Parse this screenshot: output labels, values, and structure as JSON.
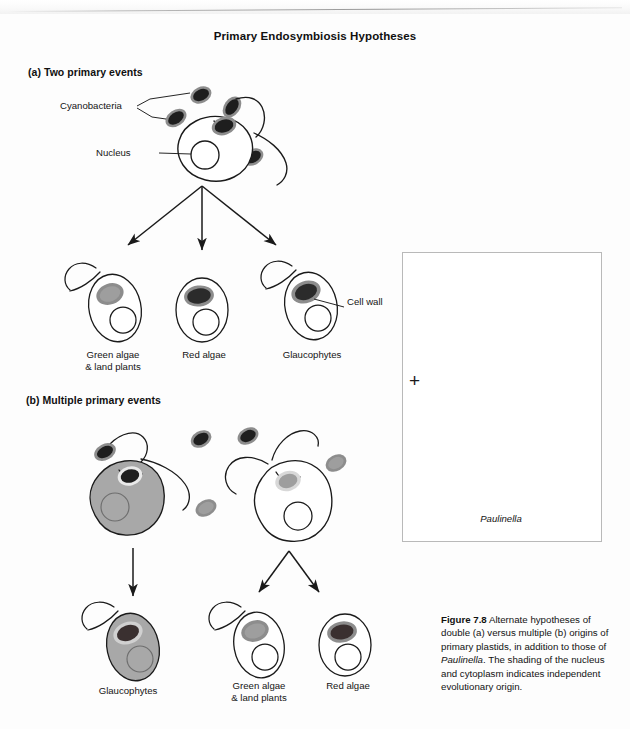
{
  "figure": {
    "title": "Primary Endosymbiosis Hypotheses",
    "number": "Figure 7.8",
    "caption_lead": "Figure 7.8",
    "caption_body_1": " Alternate hypotheses of double (a) versus multiple (b) origins of primary plastids, in addition to those of ",
    "caption_italic": "Paulinella",
    "caption_body_2": ". The shading of the nucleus and cytoplasm indicates independent evolutionary origin."
  },
  "panels": {
    "a": {
      "label": "(a) Two primary events"
    },
    "b": {
      "label": "(b) Multiple primary events"
    }
  },
  "callouts": {
    "cyanobacteria": "Cyanobacteria",
    "nucleus": "Nucleus",
    "cell_wall": "Cell wall"
  },
  "panel_a_outcomes": [
    {
      "line1": "Green algae",
      "line2": "& land plants"
    },
    {
      "line1": "Red algae",
      "line2": ""
    },
    {
      "line1": "Glaucophytes",
      "line2": ""
    }
  ],
  "panel_b_outcomes": [
    {
      "line1": "Glaucophytes",
      "line2": ""
    },
    {
      "line1": "Green algae",
      "line2": "& land plants"
    },
    {
      "line1": "Red algae",
      "line2": ""
    }
  ],
  "inset": {
    "organism": "Paulinella",
    "plus_symbol": "+"
  },
  "colors": {
    "ink": "#1a1a1a",
    "cytoplasm_gray": "#a8a8a8",
    "plastid_dark": "#2b2b2b",
    "plastid_mid": "#4a4a4a",
    "plastid_light": "#9a9a9a",
    "envelope_gray": "#8d8d8d",
    "box_border": "#b9b9b9",
    "paper": "#fdfdfd"
  }
}
